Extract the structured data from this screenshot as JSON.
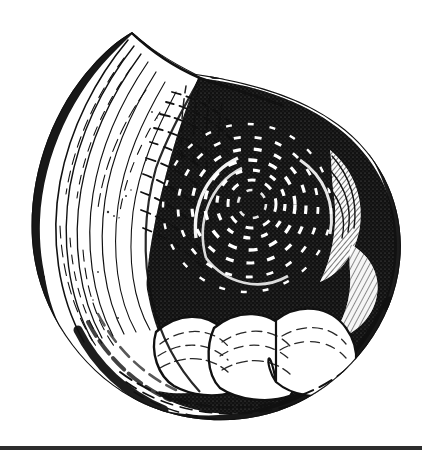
{
  "plate": {
    "background_color": "#ffffff",
    "ink_color": "#111111",
    "width": 422,
    "height": 455
  },
  "margin_rule": {
    "name": "left-margin-rule",
    "color": "#9a9a9a",
    "x": 16,
    "width": 1,
    "height": 447
  },
  "footer_rule": {
    "name": "bottom-horizontal-rule",
    "color": "#2d2d2d",
    "y": 446,
    "width": 422,
    "height": 4
  },
  "figure": {
    "subject": "coiled gastropod shell",
    "technique": "wood engraving / line-and-stipple hatching",
    "orientation": "apertural view, aperture lip at upper left",
    "bounds": {
      "left": 30,
      "top": 25,
      "right": 405,
      "bottom": 420
    },
    "parts": [
      {
        "name": "outer-lip",
        "label": "Outer lip / aperture margin",
        "description": "pale crescent of body whorl sweeping from the pointed apex at top down the left flank"
      },
      {
        "name": "apex-point",
        "label": "Lip apex",
        "description": "sharp angular point at the top of the aperture margin",
        "x": 132,
        "y": 32
      },
      {
        "name": "body-whorl",
        "label": "Body whorl",
        "description": "broad rounded mass occupying the right two thirds of the shell, inked solid black"
      },
      {
        "name": "umbilicus",
        "label": "Umbilicus / spire centre",
        "description": "dark coiled centre with dashed white spiral arcs",
        "cx": 250,
        "cy": 205
      },
      {
        "name": "growth-lines",
        "label": "Concentric growth lines",
        "description": "dense parallel arcs following the rim of the shell"
      },
      {
        "name": "basal-lobes",
        "label": "Basal lobes",
        "description": "scalloped pale lobes along the lower margin of the body whorl"
      },
      {
        "name": "shadow-rim",
        "label": "Shadow rim",
        "description": "solid black band thickening along the outer left and lower edge"
      }
    ]
  },
  "chart_data": {
    "type": "scatter",
    "title": "",
    "xlabel": "",
    "ylabel": "",
    "note": "not a chart - engraved natural history figure"
  }
}
